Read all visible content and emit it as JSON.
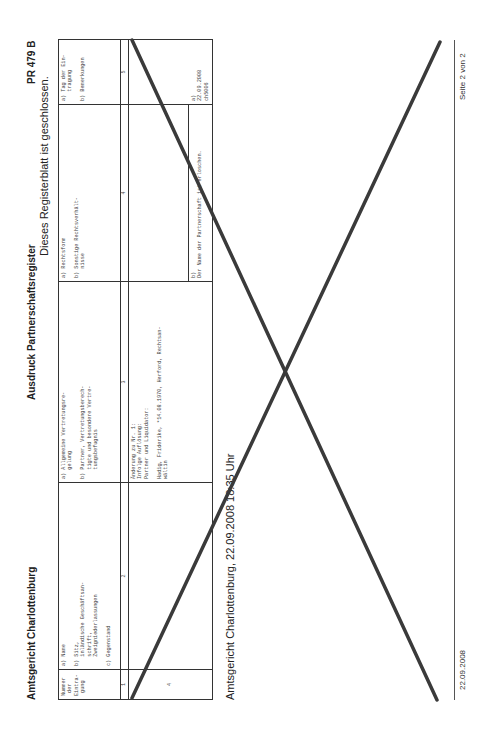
{
  "header": {
    "court": "Amtsgericht Charlottenburg",
    "title": "Ausdruck Partnerschaftsregister",
    "register_number": "PR 479 B",
    "status_note": "Dieses Registerblatt ist geschlossen."
  },
  "table": {
    "columns": [
      {
        "number": "1",
        "header": "Nummer\n der\nEintra-\n gung"
      },
      {
        "number": "2",
        "header": "a) Name\n\nb) Sitz,\n   inländische Geschäftsan-\n   schrift,\n   Zweigniederlassungen\n\nc) Gegenstand"
      },
      {
        "number": "3",
        "header": "a) Allgemeine Vertretungsre-\n   gelung\n\nb) Partner, Vertretungsberech-\n   tigte und besondere Vertre-\n   tungsbefugnis"
      },
      {
        "number": "4",
        "header": "a) Rechtsform\n\nb) Sonstige Rechtsverhält-\n   nisse"
      },
      {
        "number": "5",
        "header": "a) Tag der Ein-\n   tragung\n\nb) Bemerkungen"
      }
    ],
    "rows": [
      {
        "entry_number": "4",
        "col2": "",
        "col3": "Änderung zu Nr. 1:\nInfolge Auflösung:\nPartner und Liquidator:\n\nHadig, Friderike, *14.08.1970, Herford, Rechtsan-\nwältin",
        "col4_a": "",
        "col4_b": "b)\nDer Name der Partnerschaft ist erloschen.",
        "col5": "a)\n22.09.2008\nch5006"
      }
    ]
  },
  "stamp": "Amtsgericht Charlottenburg, 22.09.2008 18:35 Uhr",
  "footer": {
    "date": "22.09.2008",
    "page": "Seite 2 von 2"
  },
  "cancel_mark": {
    "type": "cross",
    "color": "#3a3a3a"
  }
}
